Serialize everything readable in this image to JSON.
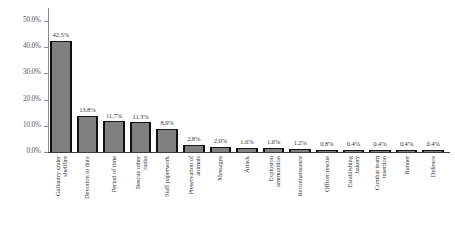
{
  "chart_data": {
    "type": "bar",
    "title": "",
    "subtitle": "",
    "xlabel": "",
    "ylabel": "",
    "ylim": [
      0,
      55
    ],
    "grid": false,
    "legend": false,
    "y_tick_labels": [
      "0.0%",
      "10.0%",
      "20.0%",
      "30.0%",
      "40.0%",
      "50.0%"
    ],
    "y_tick_values": [
      0,
      10,
      20,
      30,
      40,
      50
    ],
    "categories": [
      "Gallantry under\nshellfire",
      "Devotion to duty",
      "Period of time",
      "Rescue other\nranks",
      "Staff paperwork",
      "Preservation of\nanimals",
      "Messages",
      "Attack",
      "Explosion\nammunition",
      "Reconnaissance",
      "Officer rescue",
      "Establishing\nbakery",
      "Combat team\ninsertion",
      "Runner",
      "Defence"
    ],
    "values": [
      42.5,
      13.8,
      11.7,
      11.3,
      8.9,
      2.8,
      2.0,
      1.6,
      1.6,
      1.2,
      0.8,
      0.4,
      0.4,
      0.4,
      0.4
    ],
    "data_labels": [
      "42.5%",
      "13.8%",
      "11.7%",
      "11.3%",
      "8.9%",
      "2.8%",
      "2.0%",
      "1.6%",
      "1.6%",
      "1.2%",
      "0.8%",
      "0.4%",
      "0.4%",
      "0.4%",
      "0.4%"
    ],
    "colors": {
      "bar_fill": "#808080",
      "bar_edge": "#111111",
      "axis": "#3d3d3d",
      "tick": "#8a8a8a",
      "text": "#3c3c3c",
      "background": "#ffffff"
    }
  }
}
